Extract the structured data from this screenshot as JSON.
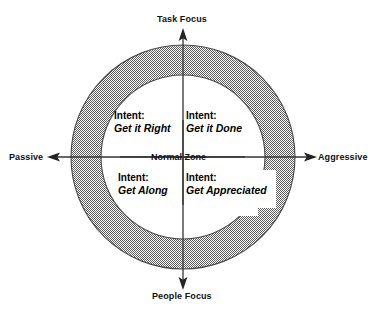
{
  "diagram": {
    "title_visible": false,
    "type": "concentric-zone-quadrant",
    "center_label": "Normal Zone",
    "colors": {
      "ring_fill": "#8c8c8c",
      "ring_stroke": "#4d4d4d",
      "background": "#ffffff",
      "text": "#111111",
      "arrow": "#333333"
    },
    "geometry": {
      "center_x": 183,
      "center_y": 157,
      "outer_radius": 112,
      "inner_radius": 82
    },
    "axes": [
      {
        "id": "top",
        "label": "Task Focus",
        "direction": "up",
        "arrow_icon": "arrow-up-icon"
      },
      {
        "id": "right",
        "label": "Aggressive",
        "direction": "right",
        "arrow_icon": "arrow-right-icon"
      },
      {
        "id": "bottom",
        "label": "People Focus",
        "direction": "down",
        "arrow_icon": "arrow-down-icon"
      },
      {
        "id": "left",
        "label": "Passive",
        "direction": "left",
        "arrow_icon": "arrow-left-icon"
      }
    ],
    "quadrants": [
      {
        "id": "top-left",
        "position": "Passive / Task Focus",
        "intent_word": "Intent:",
        "intent_value": "Get it Right"
      },
      {
        "id": "top-right",
        "position": "Aggressive / Task Focus",
        "intent_word": "Intent:",
        "intent_value": "Get it Done"
      },
      {
        "id": "bottom-left",
        "position": "Passive / People Focus",
        "intent_word": "Intent:",
        "intent_value": "Get Along"
      },
      {
        "id": "bottom-right",
        "position": "Aggressive / People Focus",
        "intent_word": "Intent:",
        "intent_value": "Get Appreciated"
      }
    ]
  }
}
